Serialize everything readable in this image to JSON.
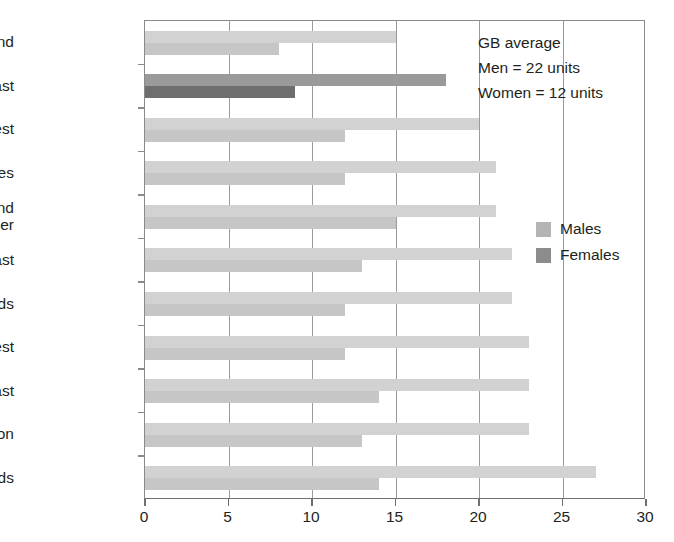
{
  "chart_data": {
    "type": "bar",
    "orientation": "horizontal",
    "title": "",
    "xlabel": "",
    "ylabel": "",
    "xlim": [
      0,
      30
    ],
    "xticks": [
      0,
      5,
      10,
      15,
      20,
      25,
      30
    ],
    "xtick_labels": [
      "0",
      "5",
      "10",
      "15",
      "20",
      "25",
      "30"
    ],
    "grid": "vertical",
    "legend_position": "right",
    "categories": [
      "Scotland",
      "North East",
      "North West",
      "Wales",
      "Yorkshire and\nThe Humber",
      "East",
      "West Midlands",
      "South West",
      "South East",
      "London",
      "East Midlands"
    ],
    "series": [
      {
        "name": "Males",
        "color": "#d2d2d2",
        "values": [
          15,
          18,
          20,
          21,
          21,
          22,
          22,
          23,
          23,
          23,
          27
        ]
      },
      {
        "name": "Females",
        "color": "#c6c6c6",
        "values": [
          8,
          9,
          12,
          12,
          15,
          13,
          12,
          12,
          14,
          13,
          14
        ]
      }
    ],
    "highlight": {
      "category": "North East",
      "male_color": "#9a9a9a",
      "female_color": "#6e6e6e"
    },
    "annotations": [
      "GB average",
      "Men = 22 units",
      "Women = 12 units"
    ]
  },
  "legend": {
    "items": [
      {
        "label": "Males",
        "color": "#b4b4b4"
      },
      {
        "label": "Females",
        "color": "#8c8c8c"
      }
    ]
  },
  "colors": {
    "axis": "#6f6f6f",
    "grid": "#9b9b9b",
    "text": "#231f20",
    "bar_male": "#d2d2d2",
    "bar_female": "#c6c6c6",
    "bar_male_highlight": "#9a9a9a",
    "bar_female_highlight": "#6e6e6e",
    "background": "#ffffff"
  }
}
